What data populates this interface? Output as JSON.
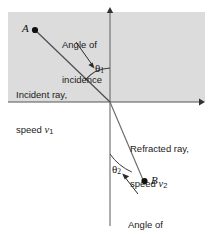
{
  "figure": {
    "colors": {
      "medium_upper_fill": "#dcdcdc",
      "medium_lower_fill": "#ffffff",
      "axis": "#555555",
      "ray": "#4f4f4f",
      "text": "#1a1a1a",
      "point": "#111111"
    },
    "labels": {
      "point_a": "A",
      "point_b": "B",
      "angle_of_incidence_line1": "Angle of",
      "angle_of_incidence_line2": "incidence",
      "incident_ray_line1": "Incident ray,",
      "incident_ray_line2_prefix": "speed ",
      "incident_ray_speed_symbol": "v",
      "incident_ray_speed_sub": "1",
      "refracted_ray_line1": "Refracted ray,",
      "refracted_ray_line2_prefix": "speed ",
      "refracted_ray_speed_symbol": "v",
      "refracted_ray_speed_sub": "2",
      "angle_of_refraction_line1": "Angle of",
      "angle_of_refraction_line2": "refraction",
      "theta_incidence": "θ",
      "theta_incidence_sub": "1",
      "theta_refraction": "θ",
      "theta_refraction_sub": "2"
    },
    "geometry": {
      "origin": [
        110,
        102
      ],
      "point_a": [
        35,
        30
      ],
      "point_b": [
        144,
        181
      ],
      "vertical_axis": [
        110,
        10,
        110,
        226
      ],
      "horizontal_axis": [
        8,
        102,
        202,
        102
      ],
      "upper_medium_rect": [
        8,
        12,
        197,
        90
      ],
      "incident_ray": [
        35,
        30,
        110,
        102
      ],
      "refracted_ray": [
        110,
        102,
        143,
        181
      ],
      "theta1_arc_radius": 34,
      "theta2_arc_radius": 52
    }
  }
}
